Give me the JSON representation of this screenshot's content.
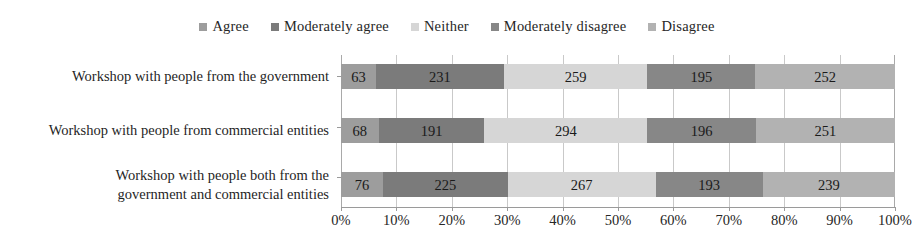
{
  "chart_data": {
    "type": "bar",
    "orientation": "horizontal",
    "stacked": true,
    "normalized": "100%",
    "title": "",
    "subtitle": "",
    "xlabel": "",
    "ylabel": "",
    "xlim": [
      0,
      100
    ],
    "xunit": "%",
    "grid": true,
    "legend_position": "top-center",
    "categories": [
      "Workshop with people from the government",
      "Workshop with people from commercial entities",
      "Workshop with people both from the government and commercial entities"
    ],
    "category_lines": [
      [
        "Workshop with people from the government"
      ],
      [
        "Workshop with people from commercial entities"
      ],
      [
        "Workshop with people both from the",
        "government and commercial entities"
      ]
    ],
    "series": [
      {
        "name": "Agree",
        "color": "#9d9d9d",
        "values": [
          63,
          68,
          76
        ]
      },
      {
        "name": "Moderately agree",
        "color": "#7b7b7b",
        "values": [
          231,
          191,
          225
        ]
      },
      {
        "name": "Neither",
        "color": "#d6d6d6",
        "values": [
          259,
          294,
          267
        ]
      },
      {
        "name": "Moderately disagree",
        "color": "#878787",
        "values": [
          195,
          196,
          193
        ]
      },
      {
        "name": "Disagree",
        "color": "#b2b2b2",
        "values": [
          252,
          251,
          239
        ]
      }
    ],
    "row_totals": [
      1000,
      1000,
      1000
    ],
    "xticks": [
      0,
      10,
      20,
      30,
      40,
      50,
      60,
      70,
      80,
      90,
      100
    ],
    "xticklabels": [
      "0%",
      "10%",
      "20%",
      "30%",
      "40%",
      "50%",
      "60%",
      "70%",
      "80%",
      "90%",
      "100%"
    ],
    "bar_labels": [
      [
        "63",
        "231",
        "259",
        "195",
        "252"
      ],
      [
        "68",
        "191",
        "294",
        "196",
        "251"
      ],
      [
        "76",
        "225",
        "267",
        "193",
        "239"
      ]
    ]
  },
  "legend": {
    "items": [
      {
        "label": "Agree",
        "color": "#9d9d9d"
      },
      {
        "label": "Moderately agree",
        "color": "#7b7b7b"
      },
      {
        "label": "Neither",
        "color": "#d6d6d6"
      },
      {
        "label": "Moderately disagree",
        "color": "#878787"
      },
      {
        "label": "Disagree",
        "color": "#b2b2b2"
      }
    ]
  },
  "colors": {
    "background": "#ffffff",
    "text": "#1c1c1c",
    "gridline": "#c9c9c9",
    "axis": "#9a9a9a"
  }
}
